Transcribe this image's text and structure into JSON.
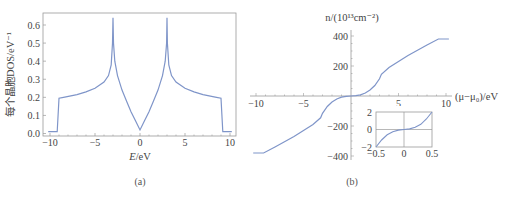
{
  "chart_data": [
    {
      "id": "a",
      "type": "line",
      "caption": "(a)",
      "title": "",
      "xlabel": "E/eV",
      "xlabel_parts": {
        "var": "E",
        "unit": "/eV"
      },
      "ylabel": "每个晶胞DOS/eV⁻¹",
      "xlim": [
        -10.5,
        10.5
      ],
      "ylim": [
        0,
        0.67
      ],
      "xticks": [
        -10,
        -5,
        0,
        5,
        10
      ],
      "xtick_labels": [
        "−10",
        "−5",
        "0",
        "5",
        "10"
      ],
      "yticks": [
        0.0,
        0.1,
        0.2,
        0.3,
        0.4,
        0.5,
        0.6
      ],
      "ytick_labels": [
        "0.0",
        "0.1",
        "0.2",
        "0.3",
        "0.4",
        "0.5",
        "0.6"
      ],
      "grid": false,
      "frame": true,
      "line_color": "#7f95c9",
      "series": [
        {
          "name": "DOS",
          "x": [
            -10.2,
            -9.2,
            -9.0,
            -8.5,
            -7,
            -6,
            -5,
            -4,
            -3.5,
            -3.2,
            -3.05,
            -3.0,
            -2.95,
            -2.8,
            -2.5,
            -2,
            -1.5,
            -1,
            -0.5,
            0,
            0.5,
            1,
            1.5,
            2,
            2.5,
            2.8,
            2.95,
            3.0,
            3.05,
            3.2,
            3.5,
            4,
            5,
            6,
            7,
            8.5,
            9.0,
            9.2,
            10.2
          ],
          "y": [
            0.01,
            0.01,
            0.195,
            0.2,
            0.215,
            0.23,
            0.25,
            0.285,
            0.32,
            0.38,
            0.5,
            0.64,
            0.5,
            0.4,
            0.32,
            0.24,
            0.18,
            0.12,
            0.07,
            0.02,
            0.07,
            0.12,
            0.18,
            0.24,
            0.32,
            0.4,
            0.5,
            0.64,
            0.5,
            0.38,
            0.32,
            0.285,
            0.25,
            0.23,
            0.215,
            0.2,
            0.195,
            0.01,
            0.01
          ]
        }
      ]
    },
    {
      "id": "b",
      "type": "line",
      "caption": "(b)",
      "title": "",
      "xlabel": "(μ−μ₀)/eV",
      "ylabel": "n/(10¹³cm⁻²)",
      "xlim": [
        -10.5,
        10.5
      ],
      "ylim": [
        -420,
        420
      ],
      "xticks": [
        -10,
        -5,
        5,
        10
      ],
      "xtick_labels": [
        "−10",
        "−5",
        "5",
        "10"
      ],
      "yticks": [
        400,
        200,
        -200,
        -400
      ],
      "ytick_labels": [
        "400",
        "200",
        "−200",
        "−400"
      ],
      "axes_through_origin": true,
      "grid": false,
      "line_color": "#7f95c9",
      "series": [
        {
          "name": "n",
          "x": [
            -10.3,
            -9.2,
            -8,
            -7,
            -6,
            -5,
            -4,
            -3.2,
            -3,
            -2.5,
            -2,
            -1.5,
            -1,
            -0.5,
            0,
            0.5,
            1,
            1.5,
            2,
            2.5,
            3,
            3.2,
            4,
            5,
            6,
            7,
            8,
            9.2,
            10.3
          ],
          "y": [
            -380,
            -380,
            -340,
            -305,
            -270,
            -230,
            -190,
            -145,
            -115,
            -70,
            -40,
            -20,
            -8,
            -2,
            0,
            2,
            8,
            20,
            40,
            70,
            115,
            145,
            190,
            230,
            270,
            305,
            340,
            380,
            380
          ]
        }
      ],
      "inset": {
        "type": "line",
        "xlim": [
          -0.5,
          0.5
        ],
        "ylim": [
          -2,
          2
        ],
        "xticks": [
          -0.5,
          0,
          0.5
        ],
        "xtick_labels": [
          "−0.5",
          "0",
          "0.5"
        ],
        "yticks": [
          2,
          0,
          -2
        ],
        "ytick_labels": [
          "2",
          "0",
          "−2"
        ],
        "grid_lines_at_zero": true,
        "series": [
          {
            "name": "n (zoom)",
            "x": [
              -0.5,
              -0.4,
              -0.3,
              -0.2,
              -0.1,
              0,
              0.1,
              0.2,
              0.3,
              0.4,
              0.5
            ],
            "y": [
              -2.0,
              -1.2,
              -0.6,
              -0.25,
              -0.07,
              0,
              0.07,
              0.25,
              0.6,
              1.2,
              2.0
            ]
          }
        ]
      }
    }
  ]
}
